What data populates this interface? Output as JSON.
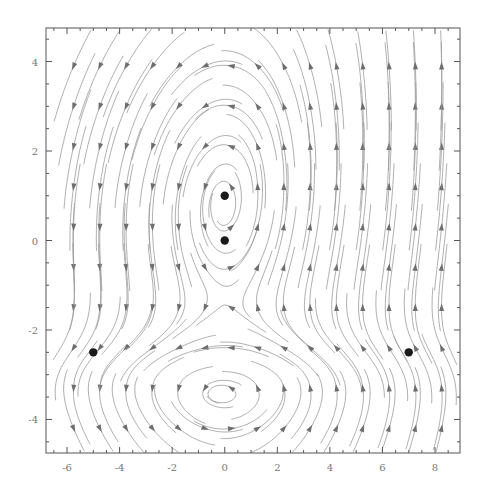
{
  "chart_data": {
    "type": "streamplot",
    "title": "",
    "xlabel": "",
    "ylabel": "",
    "xlim": [
      -6.8,
      8.95
    ],
    "ylim": [
      -4.75,
      4.75
    ],
    "grid": false,
    "legend": null,
    "x_ticks": [
      -6,
      -4,
      -2,
      0,
      2,
      4,
      6,
      8
    ],
    "x_tick_labels": [
      "-6",
      "-4",
      "-2",
      "0",
      "2",
      "4",
      "6",
      "8"
    ],
    "y_ticks": [
      -4,
      -2,
      0,
      2,
      4
    ],
    "y_tick_labels": [
      "-4",
      "-2",
      "0",
      "2",
      "4"
    ],
    "minor_tick_step_x": 0.5,
    "minor_tick_step_y": 0.5,
    "fixed_points": [
      {
        "x": 0,
        "y": 1
      },
      {
        "x": 0,
        "y": 0
      },
      {
        "x": -5,
        "y": -2.5
      },
      {
        "x": 7,
        "y": -2.5
      }
    ],
    "flow_description": {
      "left_region": "downward",
      "right_region": "upward",
      "top_center": "counter-clockwise loops around (0,1)",
      "between_lower_points": "leftward from (7,-2.5) toward (-5,-2.5)",
      "bottom_region": "leftward arcs"
    },
    "colors": {
      "stream": "#9a9a9a",
      "arrow": "#6e6e6e",
      "point": "#1a1a1a",
      "axis": "#555555"
    }
  }
}
